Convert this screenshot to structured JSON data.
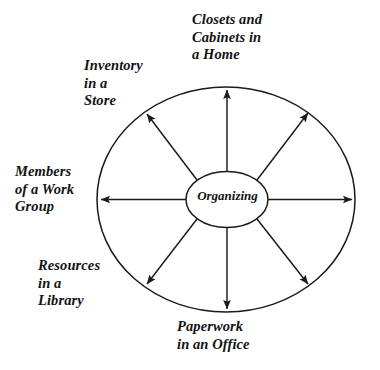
{
  "diagram": {
    "type": "radial-concept-wheel",
    "center": {
      "label": "Organizing"
    },
    "spokes": [
      {
        "id": "closets-cabinets-home",
        "label": "Closets and\nCabinets in\na Home",
        "direction": "north",
        "angle_deg": 90
      },
      {
        "id": "inventory-store",
        "label": "Inventory\nin a\nStore",
        "direction": "northwest",
        "angle_deg": 135
      },
      {
        "id": "members-work-group",
        "label": "Members\nof a Work\nGroup",
        "direction": "west",
        "angle_deg": 180
      },
      {
        "id": "resources-library",
        "label": "Resources\nin a\nLibrary",
        "direction": "southwest",
        "angle_deg": 225
      },
      {
        "id": "paperwork-office",
        "label": "Paperwork\nin an Office",
        "direction": "south",
        "angle_deg": 270
      },
      {
        "id": "unlabeled-southeast",
        "label": "",
        "direction": "southeast",
        "angle_deg": 315
      },
      {
        "id": "unlabeled-east",
        "label": "",
        "direction": "east",
        "angle_deg": 0
      },
      {
        "id": "unlabeled-northeast",
        "label": "",
        "direction": "northeast",
        "angle_deg": 45
      }
    ],
    "colors": {
      "stroke": "#1a1a1a",
      "text": "#121212",
      "background": "#ffffff"
    }
  }
}
